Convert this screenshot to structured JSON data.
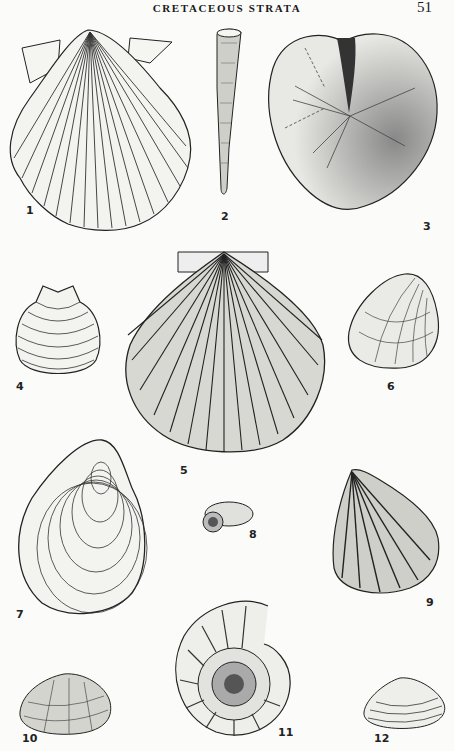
{
  "page": {
    "running_head": "CRETACEOUS STRATA",
    "page_number": "51"
  },
  "figures": [
    {
      "number": "1",
      "label": "1",
      "description": "ribbed scallop (pectinid) with ears"
    },
    {
      "number": "2",
      "label": "2",
      "description": "tapering tubular fossil"
    },
    {
      "number": "3",
      "label": "3",
      "description": "heart urchin (echinoid) with petaloid ambulacra"
    },
    {
      "number": "4",
      "label": "4",
      "description": "small concentric-ribbed bivalve"
    },
    {
      "number": "5",
      "label": "5",
      "description": "large radially ribbed scallop"
    },
    {
      "number": "6",
      "label": "6",
      "description": "oblique clam with growth lines"
    },
    {
      "number": "7",
      "label": "7",
      "description": "large oyster-like bivalve with concentric lines"
    },
    {
      "number": "8",
      "label": "8",
      "description": "small coiled gastropod"
    },
    {
      "number": "9",
      "label": "9",
      "description": "ribbed triangular bivalve"
    },
    {
      "number": "10",
      "label": "10",
      "description": "small ornamented clam"
    },
    {
      "number": "11",
      "label": "11",
      "description": "ribbed ammonite"
    },
    {
      "number": "12",
      "label": "12",
      "description": "small concentric clam"
    }
  ]
}
